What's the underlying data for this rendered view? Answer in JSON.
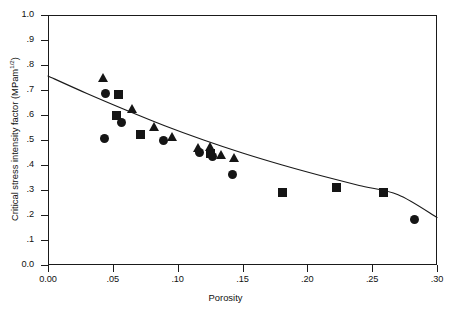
{
  "chart_data": {
    "type": "scatter",
    "title": "",
    "xlabel": "Porosity",
    "ylabel": "Critical stress intensity factor  (MPam 1/2)",
    "ylabel_main": "Critical stress intensity factor   (MPam",
    "ylabel_sup": "1/2",
    "ylabel_close": ")",
    "xlim": [
      0.0,
      0.3
    ],
    "ylim": [
      0.0,
      1.0
    ],
    "grid": false,
    "legend": "none",
    "xticks": [
      0.0,
      0.05,
      0.1,
      0.15,
      0.2,
      0.25,
      0.3
    ],
    "xtick_labels": [
      "0.00",
      ".05",
      ".10",
      ".15",
      ".20",
      ".25",
      ".30"
    ],
    "yticks": [
      0.0,
      0.1,
      0.2,
      0.3,
      0.4,
      0.5,
      0.6,
      0.7,
      0.8,
      0.9,
      1.0
    ],
    "ytick_labels": [
      "0.0",
      ".1",
      ".2",
      ".3",
      ".4",
      ".5",
      ".6",
      ".7",
      ".8",
      ".9",
      "1.0"
    ],
    "series": [
      {
        "name": "circle-series",
        "marker": "circle",
        "color": "#151515",
        "points": [
          {
            "x": 0.0432,
            "y": 0.505
          },
          {
            "x": 0.044,
            "y": 0.686
          },
          {
            "x": 0.0563,
            "y": 0.572
          },
          {
            "x": 0.0888,
            "y": 0.497
          },
          {
            "x": 0.117,
            "y": 0.452
          },
          {
            "x": 0.127,
            "y": 0.434
          },
          {
            "x": 0.1425,
            "y": 0.362
          },
          {
            "x": 0.2826,
            "y": 0.183
          }
        ]
      },
      {
        "name": "square-series",
        "marker": "square",
        "color": "#151515",
        "points": [
          {
            "x": 0.053,
            "y": 0.6
          },
          {
            "x": 0.054,
            "y": 0.684
          },
          {
            "x": 0.0713,
            "y": 0.521
          },
          {
            "x": 0.1252,
            "y": 0.446
          },
          {
            "x": 0.1805,
            "y": 0.29
          },
          {
            "x": 0.2228,
            "y": 0.31
          },
          {
            "x": 0.2585,
            "y": 0.29
          }
        ]
      },
      {
        "name": "triangle-series",
        "marker": "triangle",
        "color": "#151515",
        "points": [
          {
            "x": 0.0425,
            "y": 0.748
          },
          {
            "x": 0.0655,
            "y": 0.625
          },
          {
            "x": 0.082,
            "y": 0.553
          },
          {
            "x": 0.096,
            "y": 0.513
          },
          {
            "x": 0.116,
            "y": 0.468
          },
          {
            "x": 0.1255,
            "y": 0.47
          },
          {
            "x": 0.134,
            "y": 0.44
          },
          {
            "x": 0.144,
            "y": 0.428
          }
        ]
      }
    ],
    "fit_curve": {
      "name": "fitted-trend-curve",
      "color": "#1a1a1a",
      "points": [
        {
          "x": 0.0,
          "y": 0.756
        },
        {
          "x": 0.03,
          "y": 0.686
        },
        {
          "x": 0.06,
          "y": 0.62
        },
        {
          "x": 0.09,
          "y": 0.557
        },
        {
          "x": 0.12,
          "y": 0.5
        },
        {
          "x": 0.15,
          "y": 0.448
        },
        {
          "x": 0.18,
          "y": 0.401
        },
        {
          "x": 0.21,
          "y": 0.358
        },
        {
          "x": 0.24,
          "y": 0.318
        },
        {
          "x": 0.27,
          "y": 0.281
        },
        {
          "x": 0.3,
          "y": 0.19
        }
      ]
    }
  }
}
